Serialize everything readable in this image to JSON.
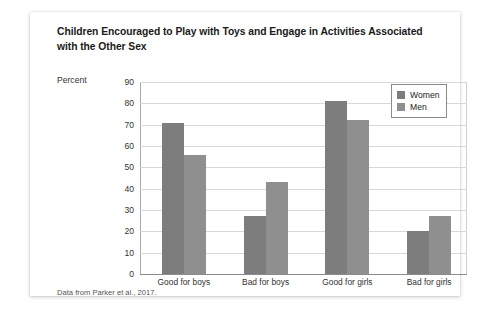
{
  "card": {
    "title": "Children Encouraged to Play with Toys and Engage in Activities Associated with the Other Sex",
    "source_note": "Data from Parker et al., 2017."
  },
  "chart_data": {
    "type": "bar",
    "title": "Children Encouraged to Play with Toys and Engage in Activities Associated with the Other Sex",
    "xlabel": "",
    "ylabel": "Percent",
    "ylim": [
      0,
      90
    ],
    "yticks": [
      0,
      10,
      20,
      30,
      40,
      50,
      60,
      70,
      80,
      90
    ],
    "ytick_labels": [
      "0",
      "10",
      "20",
      "30",
      "40",
      "50",
      "60",
      "70",
      "80",
      "90"
    ],
    "grid": true,
    "legend_position": "top-right",
    "categories": [
      "Good for boys",
      "Bad for boys",
      "Good for girls",
      "Bad for girls"
    ],
    "series": [
      {
        "name": "Women",
        "color": "#7d7d7d",
        "values": [
          71,
          27,
          81,
          20
        ]
      },
      {
        "name": "Men",
        "color": "#8f8f8f",
        "values": [
          56,
          43,
          72,
          27
        ]
      }
    ],
    "annotations": [
      "Data from Parker et al., 2017."
    ]
  }
}
